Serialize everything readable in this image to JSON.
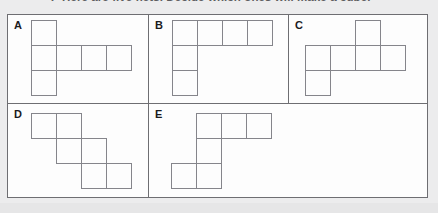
{
  "question": {
    "number": "7",
    "text": "Here are five nets. Decide which ones will make a cube."
  },
  "colors": {
    "page_background": "#ececed",
    "frame_background": "#fdfdfd",
    "frame_border": "#6e6e72",
    "cell_stroke": "#85858b",
    "label_color": "#1b1b1d",
    "question_color": "#5d5d60"
  },
  "grid": {
    "cell_size": 26,
    "columns": 4,
    "rows": 3
  },
  "panels": [
    {
      "id": "a",
      "label": "A",
      "shape_name": "t-net-left-column",
      "cells": [
        {
          "row": 0,
          "col": 0
        },
        {
          "row": 1,
          "col": 0
        },
        {
          "row": 1,
          "col": 1
        },
        {
          "row": 1,
          "col": 2
        },
        {
          "row": 1,
          "col": 3
        },
        {
          "row": 2,
          "col": 0
        }
      ]
    },
    {
      "id": "b",
      "label": "B",
      "shape_name": "l-net-top-row",
      "cells": [
        {
          "row": 0,
          "col": 0
        },
        {
          "row": 0,
          "col": 1
        },
        {
          "row": 0,
          "col": 2
        },
        {
          "row": 0,
          "col": 3
        },
        {
          "row": 1,
          "col": 0
        },
        {
          "row": 2,
          "col": 0
        }
      ]
    },
    {
      "id": "c",
      "label": "C",
      "shape_name": "cross-net-offset",
      "cells": [
        {
          "row": 0,
          "col": 2
        },
        {
          "row": 1,
          "col": 0
        },
        {
          "row": 1,
          "col": 1
        },
        {
          "row": 1,
          "col": 2
        },
        {
          "row": 1,
          "col": 3
        },
        {
          "row": 2,
          "col": 0
        }
      ]
    },
    {
      "id": "d",
      "label": "D",
      "shape_name": "staircase-net",
      "cells": [
        {
          "row": 0,
          "col": 0
        },
        {
          "row": 0,
          "col": 1
        },
        {
          "row": 1,
          "col": 1
        },
        {
          "row": 1,
          "col": 2
        },
        {
          "row": 2,
          "col": 2
        },
        {
          "row": 2,
          "col": 3
        }
      ]
    },
    {
      "id": "e",
      "label": "E",
      "shape_name": "z-net",
      "cells": [
        {
          "row": 0,
          "col": 1
        },
        {
          "row": 0,
          "col": 2
        },
        {
          "row": 0,
          "col": 3
        },
        {
          "row": 1,
          "col": 1
        },
        {
          "row": 2,
          "col": 0
        },
        {
          "row": 2,
          "col": 1
        }
      ]
    }
  ]
}
